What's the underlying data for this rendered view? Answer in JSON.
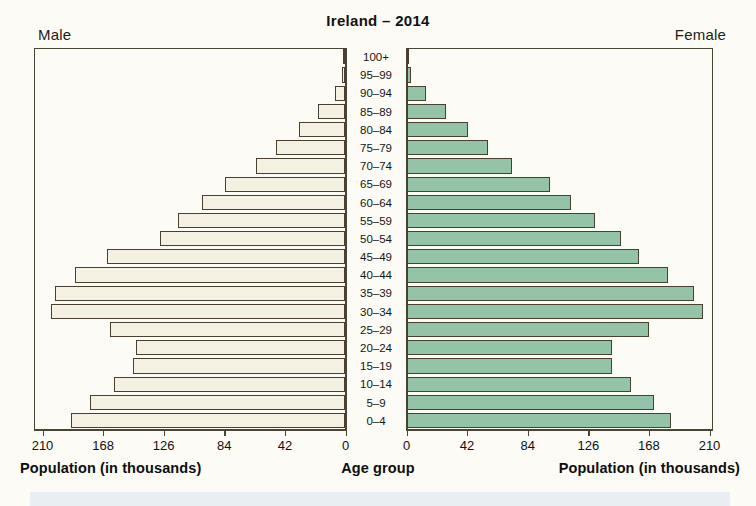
{
  "chart_data": {
    "type": "bar",
    "subtype": "population-pyramid",
    "title": "Ireland – 2014",
    "xlabel": "Population (in thousands)",
    "ylabel": "Age group",
    "xlim": [
      0,
      210
    ],
    "xticks": [
      0,
      42,
      84,
      126,
      168,
      210
    ],
    "xticklabels": [
      "0",
      "42",
      "84",
      "126",
      "168",
      "210"
    ],
    "grid": false,
    "legend_position": "none",
    "categories": [
      "100+",
      "95–99",
      "90–94",
      "85–89",
      "80–84",
      "75–79",
      "70–74",
      "65–69",
      "60–64",
      "55–59",
      "50–54",
      "45–49",
      "40–44",
      "35–39",
      "30–34",
      "25–29",
      "20–24",
      "15–19",
      "10–14",
      "5–9",
      "0–4"
    ],
    "series": [
      {
        "name": "Male",
        "side": "left",
        "color": "#f4f0e2",
        "values": [
          1,
          2,
          7,
          19,
          32,
          48,
          62,
          83,
          99,
          116,
          128,
          165,
          187,
          201,
          204,
          163,
          145,
          147,
          160,
          177,
          190
        ]
      },
      {
        "name": "Female",
        "side": "right",
        "color": "#93c4a7",
        "values": [
          1,
          3,
          13,
          27,
          42,
          56,
          73,
          99,
          114,
          130,
          148,
          161,
          181,
          199,
          205,
          168,
          142,
          142,
          155,
          171,
          183
        ]
      }
    ]
  },
  "header": {
    "title": "Ireland – 2014",
    "male_label": "Male",
    "female_label": "Female"
  },
  "axes": {
    "left_caption": "Population (in thousands)",
    "center_caption": "Age group",
    "right_caption": "Population (in thousands)",
    "left_ticklabels": [
      "210",
      "168",
      "126",
      "84",
      "42",
      "0"
    ],
    "right_ticklabels": [
      "0",
      "42",
      "84",
      "126",
      "168",
      "210"
    ]
  }
}
